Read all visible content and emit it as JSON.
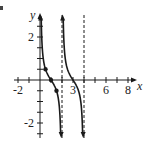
{
  "chart_data": {
    "type": "line",
    "title": "",
    "function": "y = 0.5 cot(pi x / 2)",
    "xlabel": "x",
    "ylabel": "y",
    "x_tick_labels": [
      "-2",
      "3",
      "6",
      "8"
    ],
    "y_tick_labels": [
      "2",
      "-2"
    ],
    "xlim": [
      -2.5,
      9
    ],
    "ylim": [
      -2.6,
      3
    ],
    "x_tick_step": 1,
    "y_tick_step": 0.5,
    "asymptotes": [
      0,
      2,
      4
    ],
    "dashed_asymptotes": [
      2,
      4
    ],
    "points": [
      {
        "x": 0.5,
        "y": 0.5
      },
      {
        "x": 1,
        "y": 0
      },
      {
        "x": 1.5,
        "y": -0.5
      }
    ],
    "branches": [
      {
        "from": 0,
        "to": 2
      },
      {
        "from": 2,
        "to": 4
      }
    ],
    "grid": false,
    "color": "#1a1a1a"
  },
  "labels": {
    "x_axis": "x",
    "y_axis": "y",
    "x_ticks": [
      {
        "text": "-2",
        "value": -2
      },
      {
        "text": "3",
        "value": 3
      },
      {
        "text": "6",
        "value": 6
      },
      {
        "text": "8",
        "value": 8
      }
    ],
    "y_ticks": [
      {
        "text": "2",
        "value": 2
      },
      {
        "text": "-2",
        "value": -2
      }
    ]
  }
}
